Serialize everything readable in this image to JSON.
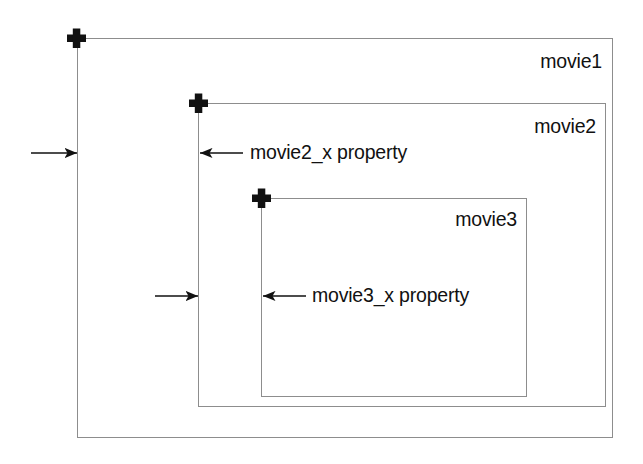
{
  "diagram": {
    "background_color": "#ffffff",
    "stroke_color": "#8d8d8d",
    "marker_color": "#111111",
    "boxes": [
      {
        "id": "movie1",
        "label": "movie1",
        "registration_marker": "plus-cross",
        "marker_position": "top-left",
        "label_position": "top-right-inside"
      },
      {
        "id": "movie2",
        "label": "movie2",
        "registration_marker": "plus-cross",
        "marker_position": "top-left",
        "label_position": "top-right-inside"
      },
      {
        "id": "movie3",
        "label": "movie3",
        "registration_marker": "plus-cross",
        "marker_position": "top-left",
        "label_position": "top-right-inside"
      }
    ],
    "annotations": [
      {
        "id": "movie2_x",
        "label": "movie2_x property",
        "from_edge": "movie1-left-edge",
        "to_edge": "movie2-left-edge",
        "left_arrow_direction": "right",
        "right_arrow_direction": "left"
      },
      {
        "id": "movie3_x",
        "label": "movie3_x property",
        "from_edge": "movie2-left-edge",
        "to_edge": "movie3-left-edge",
        "left_arrow_direction": "right",
        "right_arrow_direction": "left"
      }
    ]
  }
}
